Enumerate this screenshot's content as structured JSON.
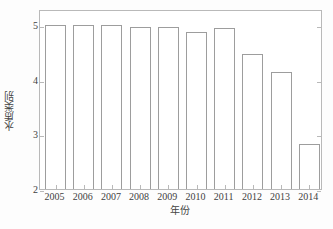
{
  "chart_data": {
    "type": "bar",
    "title": "",
    "subtitle": "",
    "xlabel": "年份",
    "ylabel": "水质类别",
    "categories": [
      "2005",
      "2006",
      "2007",
      "2008",
      "2009",
      "2010",
      "2011",
      "2012",
      "2013",
      "2014"
    ],
    "values": [
      5.0,
      5.0,
      5.0,
      4.97,
      4.97,
      4.87,
      4.96,
      4.48,
      4.14,
      2.83
    ],
    "series": [
      {
        "name": "水质类别",
        "values": [
          5.0,
          5.0,
          5.0,
          4.97,
          4.97,
          4.87,
          4.96,
          4.48,
          4.14,
          2.83
        ]
      }
    ],
    "ylim": [
      2,
      5.3
    ],
    "xlim": [
      2004.5,
      2015.2
    ],
    "yticks": [
      2,
      3,
      4,
      5
    ],
    "ytick_labels": [
      "2",
      "3",
      "4",
      "5"
    ],
    "xtick_labels": [
      "2005",
      "2006",
      "2007",
      "2008",
      "2009",
      "2010",
      "2011",
      "2012",
      "2013",
      "2014"
    ],
    "grid": false,
    "legend": null,
    "legend_position": "none",
    "bar_fill_color": "#ffffff",
    "bar_edge_color": "#9d9d9d",
    "axis_color": "#b9b9b9",
    "background_color": "#ffffff",
    "text_color": "#3f3f3f",
    "annotations": []
  },
  "axes": {
    "y_title": "水质类别",
    "x_title": "年份"
  }
}
